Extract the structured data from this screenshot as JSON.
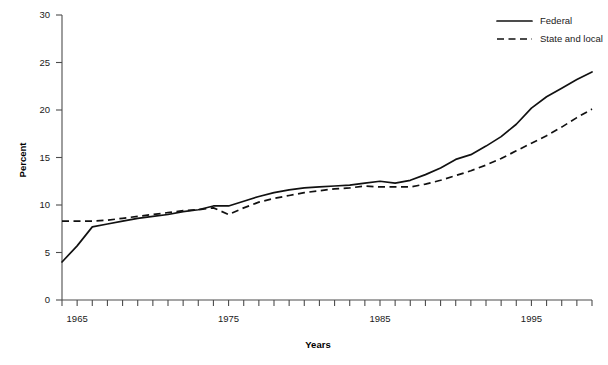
{
  "chart_data": {
    "type": "line",
    "title": "",
    "xlabel": "Years",
    "ylabel": "Percent",
    "xlim": [
      1964,
      1999
    ],
    "ylim": [
      0,
      30
    ],
    "yticks": [
      0,
      5,
      10,
      15,
      20,
      25,
      30
    ],
    "ytick_labels": [
      "0",
      "5",
      "10",
      "15",
      "20",
      "25",
      "30"
    ],
    "xticks": [
      1964,
      1965,
      1966,
      1967,
      1968,
      1969,
      1970,
      1971,
      1972,
      1973,
      1974,
      1975,
      1976,
      1977,
      1978,
      1979,
      1980,
      1981,
      1982,
      1983,
      1984,
      1985,
      1986,
      1987,
      1988,
      1989,
      1990,
      1991,
      1992,
      1993,
      1994,
      1995,
      1996,
      1997,
      1998,
      1999
    ],
    "xtick_labels_shown": [
      "1965",
      "1975",
      "1985",
      "1995"
    ],
    "xtick_labels_years": [
      1965,
      1975,
      1985,
      1995
    ],
    "grid": false,
    "legend_position": "top-right",
    "x": [
      1964,
      1965,
      1966,
      1967,
      1968,
      1969,
      1970,
      1971,
      1972,
      1973,
      1974,
      1975,
      1976,
      1977,
      1978,
      1979,
      1980,
      1981,
      1982,
      1983,
      1984,
      1985,
      1986,
      1987,
      1988,
      1989,
      1990,
      1991,
      1992,
      1993,
      1994,
      1995,
      1996,
      1997,
      1998,
      1999
    ],
    "series": [
      {
        "name": "Federal",
        "style": "solid",
        "values": [
          4.0,
          5.7,
          7.7,
          8.0,
          8.3,
          8.6,
          8.8,
          9.0,
          9.3,
          9.5,
          9.9,
          9.9,
          10.4,
          10.9,
          11.3,
          11.6,
          11.8,
          11.9,
          12.0,
          12.1,
          12.3,
          12.5,
          12.3,
          12.6,
          13.2,
          13.9,
          14.8,
          15.3,
          16.2,
          17.2,
          18.5,
          20.2,
          21.4,
          22.3,
          23.2,
          24.0
        ]
      },
      {
        "name": "State and local",
        "style": "dashed",
        "values": [
          8.3,
          8.3,
          8.3,
          8.4,
          8.6,
          8.8,
          9.0,
          9.2,
          9.4,
          9.5,
          9.7,
          9.0,
          9.7,
          10.3,
          10.7,
          11.0,
          11.3,
          11.5,
          11.7,
          11.8,
          12.0,
          11.9,
          11.9,
          11.9,
          12.2,
          12.6,
          13.1,
          13.6,
          14.2,
          14.9,
          15.7,
          16.5,
          17.3,
          18.2,
          19.2,
          20.1
        ]
      }
    ]
  },
  "legend": {
    "entries": [
      {
        "label": "Federal",
        "style": "solid"
      },
      {
        "label": "State and local",
        "style": "dashed"
      }
    ]
  },
  "axis": {
    "y_title": "Percent",
    "x_title": "Years"
  }
}
